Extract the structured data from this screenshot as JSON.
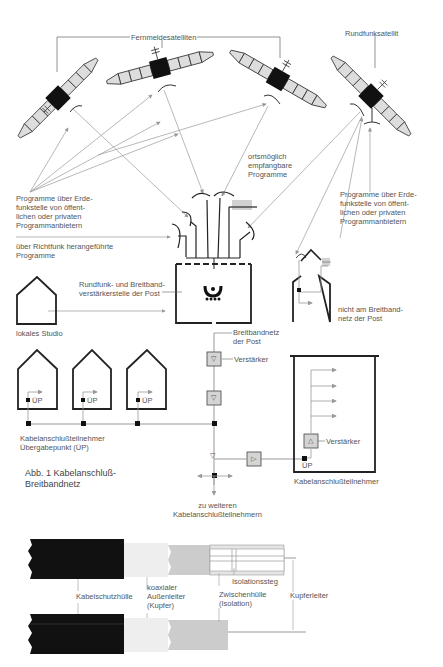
{
  "title": "Abb. 1 Kabelanschluß-\nBreitbandnetz",
  "colors": {
    "line": "#333333",
    "signal": "#999999",
    "panel_fill": "#dddddd",
    "box_fill": "#d4d4d4",
    "cable_black": "#111111",
    "outer_conductor": "#eeeeee",
    "insulation": "#cccccc"
  },
  "labels": {
    "fernmeldesatelliten": "Fernmeldesatelliten",
    "rundfunksatellit": "Rundfunksatellit",
    "ortsmoeglich": "ortsmöglich\nempfangbare\nProgramme",
    "programme_links": "Programme über Erde-\nfunkstelle von öffent-\nlichen oder privaten\nProgrammanbietern",
    "programme_rechts": "Programme über Erde-\nfunkstelle von öffent-\nlichen oder privaten\nProgrammanbietern",
    "richtfunk": "über Richtfunk herangeführte\nProgramme",
    "verstaerkerstelle": "Rundfunk- und Breitband-\nverstärkerstelle der Post",
    "lokales_studio": "lokales Studio",
    "nicht_am_netz": "nicht am Breitband-\nnetz der Post",
    "breitbandnetz": "Breitbandnetz\nder Post",
    "verstaerker_1": "Verstärker",
    "verstaerker_2": "Verstärker",
    "up": "ÜP",
    "uebergabepunkt": "Kabelanschlußteilnehmer\nÜbergabepunkt (ÜP)",
    "teilnehmer": "Kabelanschlußteilnehmer",
    "zu_weiteren": "zu weiteren\nKabelanschlußteilnehmern"
  },
  "cable": {
    "kabelschutzhuelle": "Kabelschutzhülle",
    "aussenleiter": "koaxialer\nAußenleiter\n(Kupfer)",
    "isolationssteg": "Isolationssteg",
    "zwischenhuelle": "Zwischenhülle\n(Isolation)",
    "kupferleiter": "Kupferleiter"
  },
  "amplifier_symbols": {
    "down": "▽",
    "up": "△",
    "right": "▷"
  }
}
